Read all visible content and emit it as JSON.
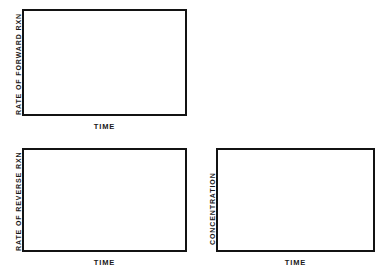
{
  "chart_data": [
    {
      "type": "line",
      "id": "forward-rate",
      "title": "",
      "xlabel": "TIME",
      "ylabel": "RATE OF FORWARD RXN",
      "series": [],
      "x": [],
      "grid": false,
      "legend": "none",
      "note": "blank plot frame, no data plotted"
    },
    {
      "type": "line",
      "id": "reverse-rate",
      "title": "",
      "xlabel": "TIME",
      "ylabel": "RATE OF REVERSE RXN",
      "series": [],
      "x": [],
      "grid": false,
      "legend": "none",
      "note": "blank plot frame, no data plotted"
    },
    {
      "type": "line",
      "id": "concentration",
      "title": "",
      "xlabel": "TIME",
      "ylabel": "CONCENTRATION",
      "series": [],
      "x": [],
      "grid": false,
      "legend": "none",
      "note": "blank plot frame, no data plotted"
    }
  ],
  "colors": {
    "frame_border": "#131313",
    "label_text": "#1a1a1a",
    "plot_background": "#ffffff",
    "page_background": "#ffffff"
  },
  "graphs": [
    {
      "ylabel": "RATE OF FORWARD RXN",
      "xlabel": "TIME"
    },
    {
      "ylabel": "RATE OF REVERSE RXN",
      "xlabel": "TIME"
    },
    {
      "ylabel": "CONCENTRATION",
      "xlabel": "TIME"
    }
  ]
}
